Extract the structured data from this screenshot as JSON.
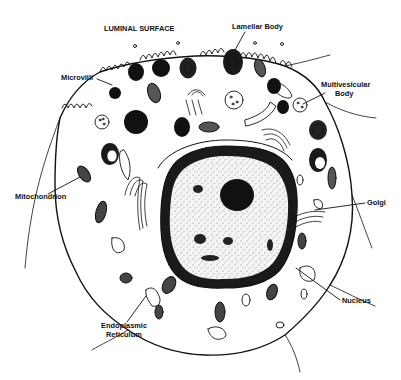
{
  "diagram": {
    "title": "LUMINAL SURFACE",
    "colors": {
      "ink": "#111111",
      "paper": "#ffffff",
      "nucleoplasm": "#f2f2f2"
    },
    "labels": [
      {
        "id": "luminal-surface",
        "text": "LUMINAL SURFACE",
        "x": 104,
        "y": 31,
        "anchor": "start"
      },
      {
        "id": "lamellar-body",
        "text": "Lamellar Body",
        "x": 232,
        "y": 29,
        "anchor": "start"
      },
      {
        "id": "microvilli",
        "text": "Microvilli",
        "x": 61,
        "y": 80,
        "anchor": "start"
      },
      {
        "id": "multivesicular-body-1",
        "text": "Multivesicular",
        "x": 321,
        "y": 87,
        "anchor": "start"
      },
      {
        "id": "multivesicular-body-2",
        "text": "Body",
        "x": 335,
        "y": 96,
        "anchor": "start"
      },
      {
        "id": "mitochondrion",
        "text": "Mitochondrion",
        "x": 15,
        "y": 199,
        "anchor": "start"
      },
      {
        "id": "golgi",
        "text": "Golgi",
        "x": 367,
        "y": 205,
        "anchor": "start"
      },
      {
        "id": "nucleus",
        "text": "Nucleus",
        "x": 342,
        "y": 303,
        "anchor": "start"
      },
      {
        "id": "er-1",
        "text": "Endoplasmic",
        "x": 101,
        "y": 328,
        "anchor": "start"
      },
      {
        "id": "er-2",
        "text": "Reticulum",
        "x": 106,
        "y": 337,
        "anchor": "start"
      }
    ]
  }
}
